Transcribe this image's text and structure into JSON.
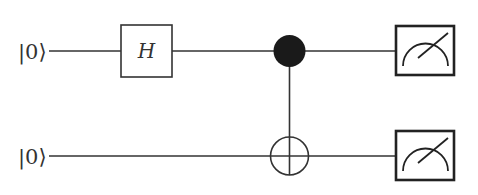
{
  "diagram": {
    "type": "quantum-circuit",
    "qubits": [
      {
        "index": 0,
        "initial_state": "|0⟩"
      },
      {
        "index": 1,
        "initial_state": "|0⟩"
      }
    ],
    "gates": [
      {
        "name": "H",
        "label": "H",
        "target": 0
      },
      {
        "name": "CNOT",
        "control": 0,
        "target": 1
      },
      {
        "name": "Measure",
        "target": 0
      },
      {
        "name": "Measure",
        "target": 1
      }
    ],
    "colors": {
      "line": "#333333",
      "control_fill": "#1a1a1a",
      "background": "#ffffff"
    }
  }
}
